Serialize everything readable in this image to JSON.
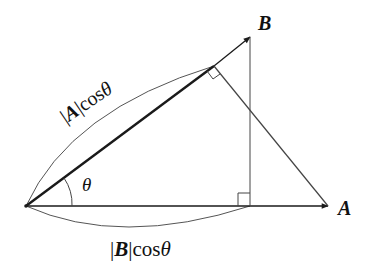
{
  "diagram": {
    "labels": {
      "vector_a": "A",
      "vector_b": "B",
      "angle": "θ",
      "proj_a_on_b_bar_open": "|",
      "proj_a_on_b_vec": "A",
      "proj_a_on_b_bar_close": "|",
      "proj_a_on_b_cos": "cos",
      "proj_a_on_b_theta": "θ",
      "proj_b_on_a_bar_open": "|",
      "proj_b_on_a_vec": "B",
      "proj_b_on_a_bar_close": "|",
      "proj_b_on_a_cos": "cos",
      "proj_b_on_a_theta": "θ"
    },
    "colors": {
      "line": "#1a1a1a",
      "thin": "#444444",
      "background": "#ffffff"
    }
  }
}
